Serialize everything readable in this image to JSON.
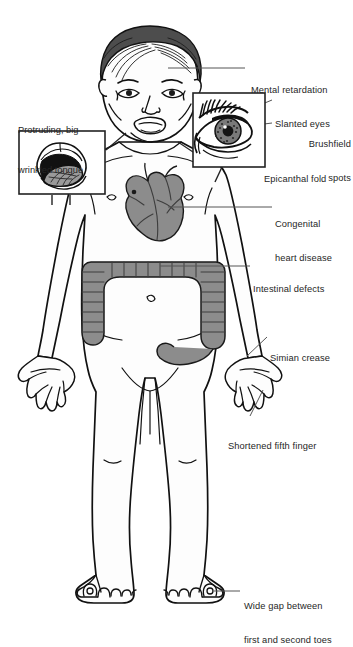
{
  "figure": {
    "background_color": "#ffffff",
    "line_color": "#111111",
    "leader_line_color": "#555555",
    "organ_fill_color": "#8c8c8c",
    "skin_fill_color": "#fdfdfd",
    "hair_fill_color": "#4d4d4d",
    "inset_border_color": "#222222"
  },
  "insets": [
    {
      "id": "tongue-inset",
      "caption_line1": "Protruding, big",
      "caption_line2": "wrinkled tongue",
      "subject": "mouth-with-protruding-tongue"
    },
    {
      "id": "eye-inset",
      "subject": "eye-with-epicanthal-fold"
    }
  ],
  "callouts": [
    {
      "id": "mental-retardation",
      "lines": [
        "Mental retardation"
      ],
      "align": "left",
      "x": 251,
      "y": 62
    },
    {
      "id": "slanted-eyes",
      "lines": [
        "Slanted eyes"
      ],
      "align": "left",
      "x": 275,
      "y": 96
    },
    {
      "id": "brushfield-spots",
      "lines": [
        "Brushfield",
        "spots"
      ],
      "align": "right",
      "x": 278,
      "y": 121
    },
    {
      "id": "epicanthal-fold",
      "lines": [
        "Epicanthal fold"
      ],
      "align": "left",
      "x": 264,
      "y": 152
    },
    {
      "id": "congenital-heart-disease",
      "lines": [
        "Congenital",
        "heart disease"
      ],
      "align": "left",
      "x": 275,
      "y": 201
    },
    {
      "id": "intestinal-defects",
      "lines": [
        "Intestinal defects"
      ],
      "align": "left",
      "x": 253,
      "y": 262
    },
    {
      "id": "simian-crease",
      "lines": [
        "Simian crease"
      ],
      "align": "left",
      "x": 270,
      "y": 333
    },
    {
      "id": "shortened-fifth-finger",
      "lines": [
        "Shortened fifth finger"
      ],
      "align": "left",
      "x": 228,
      "y": 421
    },
    {
      "id": "wide-gap-toes",
      "lines": [
        "Wide gap between",
        "first and second toes"
      ],
      "align": "left",
      "x": 244,
      "y": 583
    }
  ]
}
